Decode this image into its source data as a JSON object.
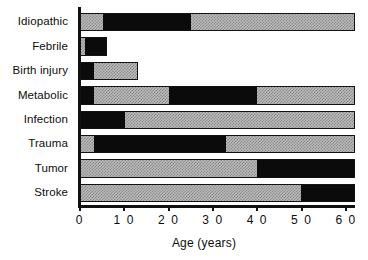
{
  "chart_data": {
    "type": "bar",
    "orientation": "horizontal",
    "title": "",
    "xlabel": "Age (years)",
    "ylabel": "",
    "xlim": [
      0,
      62
    ],
    "xticks": [
      0,
      10,
      20,
      30,
      40,
      50,
      60
    ],
    "xtick_labels": [
      "0",
      "1 0",
      "2 0",
      "3 0",
      "4 0",
      "5 0",
      "6 0"
    ],
    "grid": false,
    "legend": "none",
    "note": "Each horizontal bar spans an age range; dark (black) segments mark the peak-incidence age interval, hatched gray segments mark the remaining range covered.",
    "colors": {
      "dark": "#0b0b0b",
      "hatch": "#b9b9b9",
      "axis": "#111111",
      "background": "#ffffff"
    },
    "categories": [
      "Idiopathic",
      "Febrile",
      "Birth injury",
      "Metabolic",
      "Infection",
      "Trauma",
      "Tumor",
      "Stroke"
    ],
    "bars": [
      {
        "category": "Idiopathic",
        "start": 0,
        "end": 62,
        "segments": [
          {
            "from": 0,
            "to": 5,
            "fill": "gray"
          },
          {
            "from": 5,
            "to": 25,
            "fill": "black"
          },
          {
            "from": 25,
            "to": 62,
            "fill": "gray"
          }
        ]
      },
      {
        "category": "Febrile",
        "start": 0,
        "end": 6,
        "segments": [
          {
            "from": 0,
            "to": 1,
            "fill": "gray"
          },
          {
            "from": 1,
            "to": 6,
            "fill": "black"
          }
        ]
      },
      {
        "category": "Birth injury",
        "start": 0,
        "end": 13,
        "segments": [
          {
            "from": 0,
            "to": 3,
            "fill": "black"
          },
          {
            "from": 3,
            "to": 13,
            "fill": "gray"
          }
        ]
      },
      {
        "category": "Metabolic",
        "start": 0,
        "end": 62,
        "segments": [
          {
            "from": 0,
            "to": 3,
            "fill": "black"
          },
          {
            "from": 3,
            "to": 20,
            "fill": "gray"
          },
          {
            "from": 20,
            "to": 40,
            "fill": "black"
          },
          {
            "from": 40,
            "to": 62,
            "fill": "gray"
          }
        ]
      },
      {
        "category": "Infection",
        "start": 0,
        "end": 62,
        "segments": [
          {
            "from": 0,
            "to": 10,
            "fill": "black"
          },
          {
            "from": 10,
            "to": 62,
            "fill": "gray"
          }
        ]
      },
      {
        "category": "Trauma",
        "start": 0,
        "end": 62,
        "segments": [
          {
            "from": 0,
            "to": 3,
            "fill": "gray"
          },
          {
            "from": 3,
            "to": 33,
            "fill": "black"
          },
          {
            "from": 33,
            "to": 62,
            "fill": "gray"
          }
        ]
      },
      {
        "category": "Tumor",
        "start": 0,
        "end": 62,
        "segments": [
          {
            "from": 0,
            "to": 40,
            "fill": "gray"
          },
          {
            "from": 40,
            "to": 62,
            "fill": "black"
          }
        ]
      },
      {
        "category": "Stroke",
        "start": 0,
        "end": 62,
        "segments": [
          {
            "from": 0,
            "to": 50,
            "fill": "gray"
          },
          {
            "from": 50,
            "to": 62,
            "fill": "black"
          }
        ]
      }
    ]
  }
}
